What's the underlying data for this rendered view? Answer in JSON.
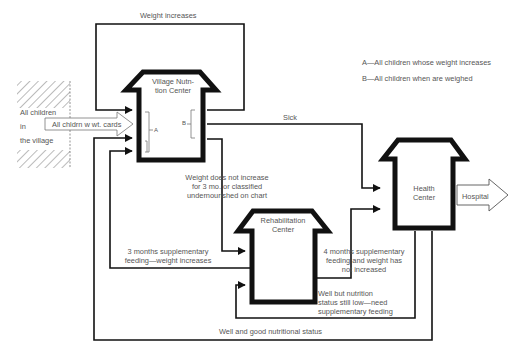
{
  "diagram": {
    "nodes": {
      "village": {
        "label": "All children\nin\nthe village",
        "lines": [
          "All children",
          "in",
          "the village"
        ]
      },
      "village_center": {
        "label": "Village Nutrition Center",
        "lines": [
          "Village Nutn-",
          "tion Center"
        ]
      },
      "rehab_center": {
        "label": "Rehabilitation Center",
        "lines": [
          "Rehabilitation",
          "Center"
        ]
      },
      "health_center": {
        "label": "Health Center",
        "lines": [
          "Health",
          "Center"
        ]
      },
      "hospital": {
        "label": "Hospital"
      }
    },
    "edges": {
      "cards": "All chldrn w wt. cards",
      "weight_increases": "Weight increases",
      "sick": "Sick",
      "not_increase": [
        "Weight does not increase",
        "for 3 mo. or classified",
        "undernourished on chart"
      ],
      "three_months": [
        "3 months supplementary",
        "feeding—weight increases"
      ],
      "four_months": [
        "4 months supplementary",
        "feeding and weight has",
        "not increased"
      ],
      "well_low": [
        "Well but nutrition",
        "status still low—need",
        "supplementary feeding"
      ],
      "well_good": "Well and good nutritional status"
    },
    "markers": {
      "a": "A",
      "b": "B"
    },
    "legend": {
      "a": "A—All children whose weight increases",
      "b": "B—All children when are weighed"
    },
    "colors": {
      "ink": "#111111",
      "text": "#555555",
      "hatch": "#777777"
    }
  }
}
